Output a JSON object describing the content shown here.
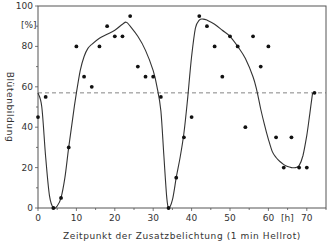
{
  "chart_data": {
    "type": "scatter",
    "title": "",
    "xlabel": "Zeitpunkt der Zusatzbelichtung (1 min Hellrot)",
    "ylabel": "Blütenbildung",
    "x_unit": "[h]",
    "y_unit": "[%]",
    "xlim": [
      0,
      75
    ],
    "ylim": [
      0,
      100
    ],
    "x_ticks": [
      0,
      10,
      20,
      30,
      40,
      50,
      60,
      70
    ],
    "y_ticks": [
      0,
      20,
      40,
      60,
      80,
      100
    ],
    "grid": false,
    "legend": null,
    "reference_line": {
      "style": "dashed",
      "y": 57
    },
    "series": [
      {
        "name": "Messwerte",
        "kind": "points",
        "points": [
          [
            0,
            45
          ],
          [
            2,
            55
          ],
          [
            4,
            0
          ],
          [
            6,
            5
          ],
          [
            8,
            30
          ],
          [
            10,
            80
          ],
          [
            12,
            65
          ],
          [
            14,
            60
          ],
          [
            16,
            80
          ],
          [
            18,
            90
          ],
          [
            20,
            85
          ],
          [
            22,
            85
          ],
          [
            24,
            95
          ],
          [
            26,
            70
          ],
          [
            28,
            65
          ],
          [
            30,
            65
          ],
          [
            32,
            55
          ],
          [
            34,
            0
          ],
          [
            36,
            15
          ],
          [
            38,
            35
          ],
          [
            40,
            45
          ],
          [
            42,
            95
          ],
          [
            44,
            90
          ],
          [
            46,
            80
          ],
          [
            48,
            65
          ],
          [
            50,
            85
          ],
          [
            52,
            80
          ],
          [
            54,
            40
          ],
          [
            56,
            85
          ],
          [
            58,
            70
          ],
          [
            60,
            80
          ],
          [
            62,
            35
          ],
          [
            64,
            20
          ],
          [
            66,
            35
          ],
          [
            68,
            20
          ],
          [
            70,
            20
          ],
          [
            72,
            57
          ]
        ]
      },
      {
        "name": "Ausgleichskurve",
        "kind": "curve",
        "points": [
          [
            0,
            57
          ],
          [
            1,
            50
          ],
          [
            2,
            25
          ],
          [
            3,
            6
          ],
          [
            4,
            0
          ],
          [
            5,
            1
          ],
          [
            6,
            5
          ],
          [
            7,
            15
          ],
          [
            8,
            30
          ],
          [
            9,
            44
          ],
          [
            10,
            57
          ],
          [
            11,
            68
          ],
          [
            12,
            75
          ],
          [
            13,
            79
          ],
          [
            14,
            81
          ],
          [
            16,
            84
          ],
          [
            18,
            86
          ],
          [
            20,
            88
          ],
          [
            22,
            91
          ],
          [
            23,
            92
          ],
          [
            24,
            90
          ],
          [
            26,
            85
          ],
          [
            28,
            78
          ],
          [
            30,
            68
          ],
          [
            31,
            60
          ],
          [
            32,
            48
          ],
          [
            32.8,
            25
          ],
          [
            33.5,
            6
          ],
          [
            34,
            0
          ],
          [
            35,
            4
          ],
          [
            36,
            15
          ],
          [
            37,
            25
          ],
          [
            38,
            37
          ],
          [
            39,
            55
          ],
          [
            40,
            75
          ],
          [
            41,
            89
          ],
          [
            42,
            93
          ],
          [
            43,
            93.5
          ],
          [
            44,
            93
          ],
          [
            46,
            91
          ],
          [
            48,
            88
          ],
          [
            50,
            85
          ],
          [
            52,
            80
          ],
          [
            54,
            74
          ],
          [
            56,
            65
          ],
          [
            57,
            58
          ],
          [
            58,
            49
          ],
          [
            59,
            41
          ],
          [
            60,
            34
          ],
          [
            61,
            28
          ],
          [
            62,
            25
          ],
          [
            63,
            23
          ],
          [
            64,
            21.5
          ],
          [
            65,
            20.5
          ],
          [
            66,
            20
          ],
          [
            67,
            20
          ],
          [
            68,
            21
          ],
          [
            69,
            26
          ],
          [
            70,
            36
          ],
          [
            70.8,
            47
          ],
          [
            71.5,
            57
          ]
        ]
      }
    ]
  }
}
